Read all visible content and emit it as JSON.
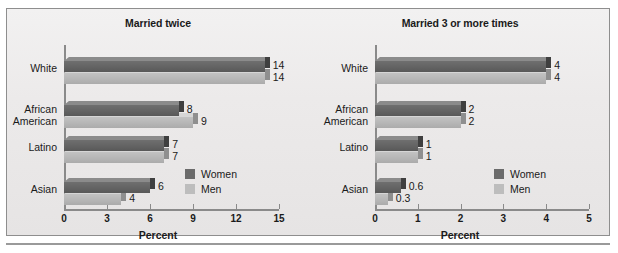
{
  "figure": {
    "background_color": "#eceaea",
    "border_color": "#8e8e8e",
    "women_color": "#636363",
    "men_color": "#b6b6b6"
  },
  "legend": {
    "women_label": "Women",
    "men_label": "Men"
  },
  "chart_data": [
    {
      "type": "bar",
      "orientation": "horizontal",
      "title": "Married twice",
      "xlabel": "Percent",
      "ylabel": "",
      "categories": [
        "White",
        "African\nAmerican",
        "Latino",
        "Asian"
      ],
      "series": [
        {
          "name": "Women",
          "values": [
            14,
            8,
            7,
            6
          ],
          "labels": [
            "14",
            "8",
            "7",
            "6"
          ]
        },
        {
          "name": "Men",
          "values": [
            14,
            9,
            7,
            4
          ],
          "labels": [
            "14",
            "9",
            "7",
            "4"
          ]
        }
      ],
      "xticks": [
        0,
        3,
        6,
        9,
        12,
        15
      ],
      "xtick_labels": [
        "0",
        "3",
        "6",
        "9",
        "12",
        "15"
      ],
      "xlim": [
        0,
        15
      ],
      "grid": false,
      "legend_position": "lower-right"
    },
    {
      "type": "bar",
      "orientation": "horizontal",
      "title": "Married 3 or more times",
      "xlabel": "Percent",
      "ylabel": "",
      "categories": [
        "White",
        "African\nAmerican",
        "Latino",
        "Asian"
      ],
      "series": [
        {
          "name": "Women",
          "values": [
            4,
            2,
            1,
            0.6
          ],
          "labels": [
            "4",
            "2",
            "1",
            "0.6"
          ]
        },
        {
          "name": "Men",
          "values": [
            4,
            2,
            1,
            0.3
          ],
          "labels": [
            "4",
            "2",
            "1",
            "0.3"
          ]
        }
      ],
      "xticks": [
        0,
        1,
        2,
        3,
        4,
        5
      ],
      "xtick_labels": [
        "0",
        "1",
        "2",
        "3",
        "4",
        "5"
      ],
      "xlim": [
        0,
        5
      ],
      "grid": false,
      "legend_position": "lower-right"
    }
  ]
}
